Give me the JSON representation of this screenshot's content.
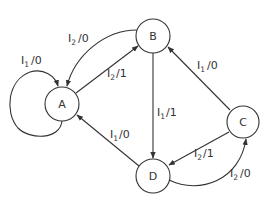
{
  "diagram": {
    "type": "state-machine",
    "nodes": [
      {
        "id": "A",
        "label": "A"
      },
      {
        "id": "B",
        "label": "B"
      },
      {
        "id": "C",
        "label": "C"
      },
      {
        "id": "D",
        "label": "D"
      }
    ],
    "edges": [
      {
        "from": "A",
        "to": "A",
        "input": "I",
        "input_sub": "1",
        "output": "/0"
      },
      {
        "from": "B",
        "to": "A",
        "input": "I",
        "input_sub": "2",
        "output": "/0"
      },
      {
        "from": "A",
        "to": "B",
        "input": "I",
        "input_sub": "2",
        "output": "/1"
      },
      {
        "from": "B",
        "to": "D",
        "input": "I",
        "input_sub": "1",
        "output": "/1"
      },
      {
        "from": "C",
        "to": "B",
        "input": "I",
        "input_sub": "1",
        "output": "/0"
      },
      {
        "from": "C",
        "to": "D",
        "input": "I",
        "input_sub": "2",
        "output": "/1"
      },
      {
        "from": "D",
        "to": "C",
        "input": "I",
        "input_sub": "2",
        "output": "/0"
      },
      {
        "from": "D",
        "to": "A",
        "input": "I",
        "input_sub": "1",
        "output": "/0"
      }
    ]
  }
}
